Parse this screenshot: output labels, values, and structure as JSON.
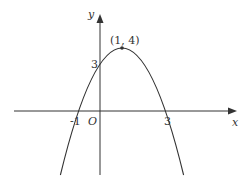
{
  "diagram": {
    "axes": {
      "x_label": "x",
      "y_label": "y",
      "origin_label": "O"
    },
    "labels": {
      "vertex": "(1, 4)",
      "y_intercept": "3",
      "x_root_left": "-1",
      "x_root_right": "3"
    },
    "function": "y = -(x-1)^2 + 4",
    "vertex": [
      1,
      4
    ],
    "roots": [
      -1,
      3
    ],
    "y_intercept": 3,
    "colors": {
      "stroke": "#333333",
      "background": "#ffffff"
    }
  }
}
